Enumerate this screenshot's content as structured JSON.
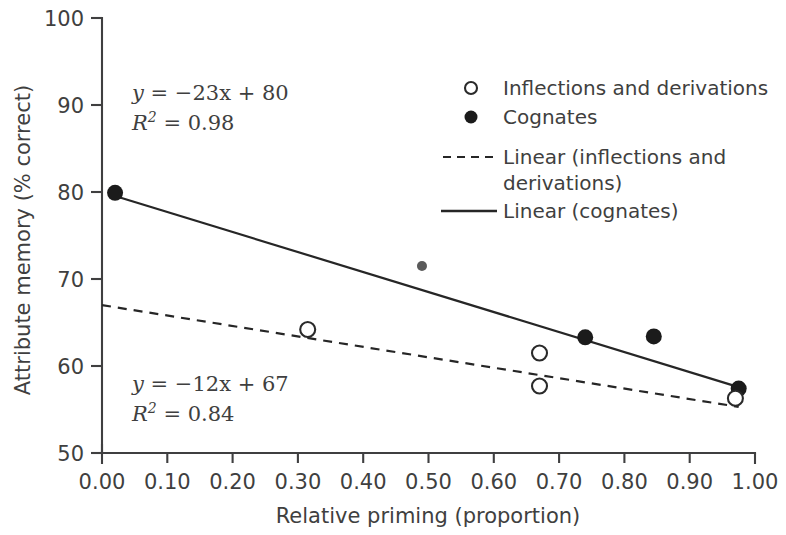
{
  "chart_data": {
    "type": "scatter",
    "title": "",
    "xlabel": "Relative priming (proportion)",
    "ylabel": "Attribute memory (% correct)",
    "xlim": [
      0.0,
      1.0
    ],
    "ylim": [
      50,
      100
    ],
    "grid": false,
    "legend_position": "top-right",
    "x_ticks": [
      "0.00",
      "0.10",
      "0.20",
      "0.30",
      "0.40",
      "0.50",
      "0.60",
      "0.70",
      "0.80",
      "0.90",
      "1.00"
    ],
    "x_tick_values": [
      0.0,
      0.1,
      0.2,
      0.3,
      0.4,
      0.5,
      0.6,
      0.7,
      0.8,
      0.9,
      1.0
    ],
    "y_ticks": [
      "50",
      "60",
      "70",
      "80",
      "90",
      "100"
    ],
    "y_tick_values": [
      50,
      60,
      70,
      80,
      90,
      100
    ],
    "series": [
      {
        "name": "Cognates",
        "marker": "filled-circle",
        "color": "#1b1b1b",
        "points": [
          {
            "x": 0.02,
            "y": 79.9
          },
          {
            "x": 0.49,
            "y": 71.5
          },
          {
            "x": 0.74,
            "y": 63.3
          },
          {
            "x": 0.845,
            "y": 63.4
          },
          {
            "x": 0.975,
            "y": 57.4
          }
        ]
      },
      {
        "name": "Inflections and derivations",
        "marker": "open-circle",
        "color": "#2a2a2a",
        "points": [
          {
            "x": 0.315,
            "y": 64.2
          },
          {
            "x": 0.67,
            "y": 61.5
          },
          {
            "x": 0.67,
            "y": 57.7
          },
          {
            "x": 0.97,
            "y": 56.3
          }
        ]
      }
    ],
    "fits": [
      {
        "name": "Linear (cognates)",
        "style": "solid",
        "slope": -23,
        "intercept": 80,
        "r_squared": 0.98,
        "x_start": 0.02,
        "x_end": 0.98
      },
      {
        "name": "Linear (inflections and derivations)",
        "style": "dashed",
        "slope": -12,
        "intercept": 67,
        "r_squared": 0.84,
        "x_start": 0.0,
        "x_end": 0.975
      }
    ],
    "annotations": [
      {
        "id": "cognates-equation",
        "line1_var": "y",
        "line1_rest": " = −23x + 80",
        "line2_var": "R",
        "line2_sup": "2",
        "line2_rest": " = 0.98",
        "x": 0.27,
        "y": 90.5
      },
      {
        "id": "inflections-equation",
        "line1_var": "y",
        "line1_rest": " = −12x + 67",
        "line2_var": "R",
        "line2_sup": "2",
        "line2_rest": " = 0.84",
        "x": 0.27,
        "y": 60.0
      }
    ]
  },
  "legend": {
    "entries": [
      {
        "label": "Inflections and derivations",
        "marker": "open-circle-icon"
      },
      {
        "label": "Cognates",
        "marker": "filled-circle-icon"
      },
      {
        "label": "Linear (inflections and",
        "label2": "derivations)",
        "marker": "dashed-line-icon"
      },
      {
        "label": "Linear (cognates)",
        "marker": "solid-line-icon"
      }
    ]
  },
  "axes": {
    "x_title": "Relative priming (proportion)",
    "y_title": "Attribute memory (% correct)",
    "x_tick_labels": [
      "0.00",
      "0.10",
      "0.20",
      "0.30",
      "0.40",
      "0.50",
      "0.60",
      "0.70",
      "0.80",
      "0.90",
      "1.00"
    ],
    "y_tick_labels": [
      "50",
      "60",
      "70",
      "80",
      "90",
      "100"
    ]
  },
  "colors": {
    "ink": "#3f3f40",
    "marker_fill": "#1b1b1b",
    "line": "#262626",
    "background": "#ffffff"
  }
}
